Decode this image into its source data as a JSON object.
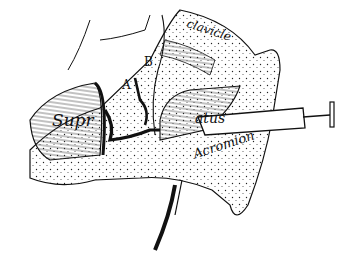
{
  "figure": {
    "labels": {
      "supraspinatus_left": "Supr",
      "supraspinatus_right": "atus",
      "clavicle": "clavicle",
      "acromion": "Acromion",
      "point_a": "A",
      "point_b": "B"
    }
  }
}
